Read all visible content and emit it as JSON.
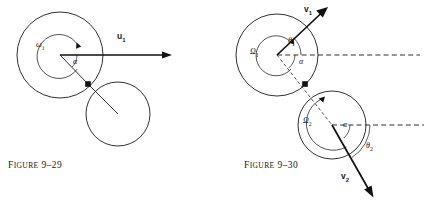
{
  "page": {
    "width": 425,
    "height": 201,
    "background": "#ffffff",
    "ink_color": "#1a1a1a"
  },
  "figures": [
    {
      "id": "figure-9-29",
      "caption_lead": "F",
      "caption_rest": "IGURE",
      "caption_number": "9–29",
      "caption_full": "FIGURE 9–29",
      "caption_x": 8,
      "caption_y": 160,
      "description": "Two tangent circles before impact; large sphere with angular velocity omega-1 and translational velocity u-1 directed horizontally to the right, line of centers making angle alpha with the velocity.",
      "labels": [
        {
          "name": "omega-1",
          "text": "ω",
          "sub": "1",
          "x": 36,
          "y": 41,
          "kind": "symbol"
        },
        {
          "name": "alpha",
          "text": "α",
          "sub": "",
          "x": 73,
          "y": 58,
          "kind": "symbol"
        },
        {
          "name": "u-1",
          "text": "u",
          "sub": "1",
          "x": 117,
          "y": 32,
          "kind": "vector"
        }
      ],
      "geometry": {
        "primary_circle": {
          "cx": 60,
          "cy": 55,
          "r": 43
        },
        "secondary_circle": {
          "cx": 118,
          "cy": 114,
          "r": 32
        },
        "contact_point": {
          "x": 88,
          "y": 84
        },
        "spin_arc_radius": 22,
        "angle_arc_radius": 17,
        "velocity_arrow": {
          "x1": 60,
          "y1": 55,
          "x2": 172,
          "y2": 55
        },
        "radius_line_secondary": {
          "x1": 88,
          "y1": 84,
          "x2": 118,
          "y2": 114
        }
      }
    },
    {
      "id": "figure-9-30",
      "caption_lead": "F",
      "caption_rest": "IGURE",
      "caption_number": "9–30",
      "caption_full": "FIGURE 9–30",
      "caption_x": 244,
      "caption_y": 160,
      "description": "Two tangent circles after impact; upper sphere has angular velocity Omega-1 and velocity v-1 at angle theta-1 above the horizontal reference, lower sphere has angular velocity Omega-2 and velocity v-2 at angle theta-2 below the horizontal reference; alpha marks the line of centers.",
      "labels": [
        {
          "name": "omega-capital-1",
          "text": "Ω",
          "sub": "1",
          "x": 250,
          "y": 48,
          "kind": "symbol"
        },
        {
          "name": "theta-1",
          "text": "θ",
          "sub": "1",
          "x": 288,
          "y": 37,
          "kind": "symbol"
        },
        {
          "name": "alpha-upper",
          "text": "α",
          "sub": "",
          "x": 299,
          "y": 58,
          "kind": "symbol"
        },
        {
          "name": "v-1",
          "text": "v",
          "sub": "1",
          "x": 304,
          "y": 5,
          "kind": "vector"
        },
        {
          "name": "omega-capital-2",
          "text": "Ω",
          "sub": "2",
          "x": 303,
          "y": 117,
          "kind": "symbol"
        },
        {
          "name": "alpha-lower",
          "text": "α",
          "sub": "",
          "x": 343,
          "y": 121,
          "kind": "symbol"
        },
        {
          "name": "theta-2",
          "text": "θ",
          "sub": "2",
          "x": 366,
          "y": 142,
          "kind": "symbol"
        },
        {
          "name": "v-2",
          "text": "v",
          "sub": "2",
          "x": 341,
          "y": 172,
          "kind": "vector"
        }
      ],
      "geometry": {
        "primary_circle": {
          "cx": 277,
          "cy": 55,
          "r": 41
        },
        "secondary_circle": {
          "cx": 332,
          "cy": 125,
          "r": 34
        },
        "contact_point": {
          "x": 305,
          "y": 84
        },
        "spin_arc_radius_upper": 20,
        "spin_arc_radius_lower": 26,
        "reference_line_upper": {
          "x1": 277,
          "y1": 55,
          "x2": 420,
          "y2": 55
        },
        "reference_line_lower": {
          "x1": 332,
          "y1": 125,
          "x2": 424,
          "y2": 125
        },
        "velocity_arrow_1": {
          "x1": 277,
          "y1": 55,
          "x2": 327,
          "y2": 8
        },
        "velocity_arrow_2": {
          "x1": 332,
          "y1": 125,
          "x2": 373,
          "y2": 197
        },
        "line_of_centers": {
          "x1": 277,
          "y1": 55,
          "x2": 332,
          "y2": 125
        }
      }
    }
  ]
}
